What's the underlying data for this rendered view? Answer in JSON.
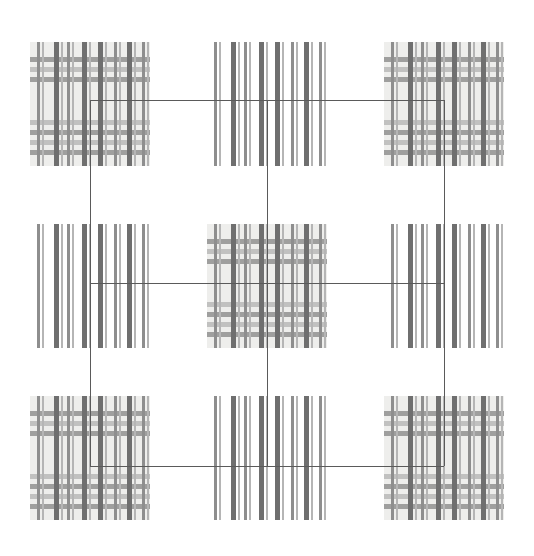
{
  "figure": {
    "title": "",
    "kind": "texture-grid-diagram",
    "canvas": {
      "width": 534,
      "height": 556
    },
    "background_color": "#ffffff"
  },
  "palette": {
    "patch_background": "#eeeeec",
    "stripe_dark": "#6f6f6f",
    "stripe_mid": "#8e8e8e",
    "stripe_light": "#b5b5b5",
    "horizontal_band": "#9a9a9a",
    "connector_line": "#5a5a5a",
    "page_white": "#ffffff"
  },
  "grid": {
    "rows": 3,
    "cols": 3,
    "cell_labels": [
      [
        "top-left",
        "top-center",
        "top-right"
      ],
      [
        "middle-left",
        "center",
        "middle-right"
      ],
      [
        "bottom-left",
        "bottom-center",
        "bottom-right"
      ]
    ]
  },
  "patches": [
    {
      "name": "patch-top-left",
      "row": 0,
      "col": 0,
      "type": "plaid",
      "has_background": true,
      "has_horizontal_stripes": true,
      "x": 30,
      "y": 42,
      "w": 120,
      "h": 124
    },
    {
      "name": "patch-top-center",
      "row": 0,
      "col": 1,
      "type": "vertical-only",
      "has_background": false,
      "has_horizontal_stripes": false,
      "x": 207,
      "y": 42,
      "w": 120,
      "h": 124
    },
    {
      "name": "patch-top-right",
      "row": 0,
      "col": 2,
      "type": "plaid",
      "has_background": true,
      "has_horizontal_stripes": true,
      "x": 384,
      "y": 42,
      "w": 120,
      "h": 124
    },
    {
      "name": "patch-middle-left",
      "row": 1,
      "col": 0,
      "type": "vertical-only",
      "has_background": false,
      "has_horizontal_stripes": false,
      "x": 30,
      "y": 224,
      "w": 120,
      "h": 124
    },
    {
      "name": "patch-center",
      "row": 1,
      "col": 1,
      "type": "plaid",
      "has_background": true,
      "has_horizontal_stripes": true,
      "x": 207,
      "y": 224,
      "w": 120,
      "h": 124
    },
    {
      "name": "patch-middle-right",
      "row": 1,
      "col": 2,
      "type": "vertical-only",
      "has_background": false,
      "has_horizontal_stripes": false,
      "x": 384,
      "y": 224,
      "w": 120,
      "h": 124
    },
    {
      "name": "patch-bottom-left",
      "row": 2,
      "col": 0,
      "type": "plaid",
      "has_background": true,
      "has_horizontal_stripes": true,
      "x": 30,
      "y": 396,
      "w": 120,
      "h": 124
    },
    {
      "name": "patch-bottom-center",
      "row": 2,
      "col": 1,
      "type": "vertical-only",
      "has_background": false,
      "has_horizontal_stripes": false,
      "x": 207,
      "y": 396,
      "w": 120,
      "h": 124
    },
    {
      "name": "patch-bottom-right",
      "row": 2,
      "col": 2,
      "type": "plaid",
      "has_background": true,
      "has_horizontal_stripes": true,
      "x": 384,
      "y": 396,
      "w": 120,
      "h": 124
    }
  ],
  "stripe_model": {
    "vertical_group_offsets_pct": [
      6,
      20,
      31,
      43,
      57,
      70,
      81,
      93
    ],
    "horizontal_band_offsets_pct": [
      12,
      20,
      28,
      63,
      71,
      79,
      87
    ],
    "vertical_stripe_widths_px": [
      3,
      5,
      3,
      5,
      5,
      3,
      5,
      3
    ],
    "horizontal_band_height_px": 5
  },
  "connectors": [
    {
      "name": "connector-top-horizontal",
      "orientation": "h",
      "x": 90,
      "y": 100,
      "length": 354
    },
    {
      "name": "connector-left-vertical",
      "orientation": "v",
      "x": 90,
      "y": 100,
      "length": 366
    },
    {
      "name": "connector-right-vertical",
      "orientation": "v",
      "x": 444,
      "y": 100,
      "length": 366
    },
    {
      "name": "connector-bottom-horizontal",
      "orientation": "h",
      "x": 90,
      "y": 466,
      "length": 354
    },
    {
      "name": "connector-middle-horizontal",
      "orientation": "h",
      "x": 90,
      "y": 283,
      "length": 354
    },
    {
      "name": "connector-center-vertical",
      "orientation": "v",
      "x": 267,
      "y": 100,
      "length": 366
    }
  ]
}
